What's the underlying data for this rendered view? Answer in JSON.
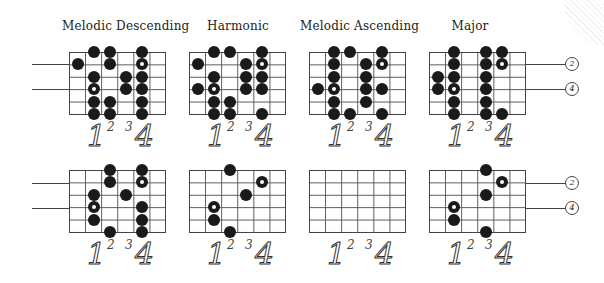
{
  "titles": [
    "Melodic Descending",
    "Harmonic",
    "Melodic Ascending",
    "Major"
  ],
  "finger_labels": {
    "one": "1",
    "two": "2",
    "three": "3",
    "four": "4"
  },
  "string_labels": {
    "upper": "2",
    "lower": "4"
  },
  "diagram": {
    "grid_columns": 6,
    "strings": 6,
    "top_row": [
      {
        "name": "Melodic Descending",
        "dots": [
          [
            0,
            1
          ],
          [
            2,
            1
          ],
          [
            3,
            1,
            "open"
          ],
          [
            4,
            1
          ],
          [
            5,
            1
          ],
          [
            0,
            2
          ],
          [
            1,
            2
          ],
          [
            4,
            2
          ],
          [
            5,
            2
          ],
          [
            1,
            0
          ],
          [
            2,
            3
          ],
          [
            3,
            3
          ],
          [
            0,
            4
          ],
          [
            1,
            4,
            "open"
          ],
          [
            2,
            4
          ],
          [
            3,
            4
          ],
          [
            4,
            4
          ],
          [
            5,
            4
          ]
        ]
      },
      {
        "name": "Harmonic",
        "dots": [
          [
            1,
            0
          ],
          [
            3,
            0
          ],
          [
            0,
            1
          ],
          [
            2,
            1
          ],
          [
            3,
            1,
            "open"
          ],
          [
            4,
            1
          ],
          [
            5,
            1
          ],
          [
            0,
            2
          ],
          [
            4,
            2
          ],
          [
            5,
            2
          ],
          [
            1,
            3
          ],
          [
            2,
            3
          ],
          [
            3,
            3
          ],
          [
            0,
            4
          ],
          [
            1,
            4,
            "open"
          ],
          [
            2,
            4
          ],
          [
            3,
            4
          ],
          [
            5,
            4
          ]
        ]
      },
      {
        "name": "Melodic Ascending",
        "dots": [
          [
            3,
            0
          ],
          [
            0,
            1
          ],
          [
            1,
            1
          ],
          [
            2,
            1
          ],
          [
            3,
            1,
            "open"
          ],
          [
            4,
            1
          ],
          [
            5,
            1
          ],
          [
            0,
            2
          ],
          [
            5,
            2
          ],
          [
            1,
            3
          ],
          [
            2,
            3
          ],
          [
            3,
            3
          ],
          [
            4,
            3
          ],
          [
            0,
            4
          ],
          [
            1,
            4,
            "open"
          ],
          [
            3,
            4
          ],
          [
            5,
            4
          ]
        ]
      },
      {
        "name": "Major",
        "dots": [
          [
            2,
            0
          ],
          [
            3,
            0
          ],
          [
            0,
            1
          ],
          [
            1,
            1
          ],
          [
            2,
            1
          ],
          [
            3,
            1,
            "open"
          ],
          [
            4,
            1
          ],
          [
            5,
            1
          ],
          [
            0,
            3
          ],
          [
            1,
            3
          ],
          [
            2,
            3
          ],
          [
            3,
            3
          ],
          [
            4,
            3
          ],
          [
            5,
            3
          ],
          [
            0,
            4
          ],
          [
            1,
            4,
            "open"
          ],
          [
            5,
            4
          ]
        ]
      }
    ],
    "bottom_row": [
      {
        "dots": [
          [
            2,
            1
          ],
          [
            3,
            1,
            "open"
          ],
          [
            4,
            1
          ],
          [
            0,
            2
          ],
          [
            1,
            2
          ],
          [
            5,
            2
          ],
          [
            2,
            3
          ],
          [
            0,
            4
          ],
          [
            1,
            4,
            "open"
          ],
          [
            3,
            4
          ],
          [
            4,
            4
          ],
          [
            5,
            4
          ]
        ]
      },
      {
        "dots": [
          [
            0,
            2
          ],
          [
            5,
            2
          ],
          [
            1,
            4,
            "open"
          ],
          [
            2,
            3
          ],
          [
            3,
            1,
            "open"
          ],
          [
            4,
            1
          ]
        ]
      },
      {
        "dots": []
      },
      {
        "dots": [
          [
            0,
            3
          ],
          [
            2,
            3
          ],
          [
            5,
            3
          ],
          [
            1,
            4,
            "open"
          ],
          [
            3,
            1,
            "open"
          ],
          [
            4,
            1
          ]
        ]
      }
    ]
  }
}
